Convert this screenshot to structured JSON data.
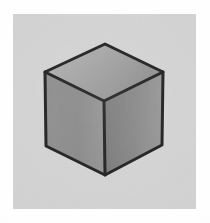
{
  "figure": {
    "title": "Shaded cube line drawing",
    "caption": "",
    "medium": "grayscale scanned illustration",
    "subject_name": "cube",
    "background_color": "#d2d2d2",
    "border_color": "#fefefe",
    "outline_color": "#1c1c1c",
    "panel": {
      "x": 13,
      "y": 14,
      "width": 183,
      "height": 195
    },
    "canvas": {
      "width": 210,
      "height": 223
    }
  },
  "cube": {
    "name": "cube",
    "projection": "isometric",
    "outline_width_px": 3,
    "vertices": {
      "top_apex": [
        105,
        44
      ],
      "upper_left": [
        45,
        72
      ],
      "upper_right": [
        163,
        72
      ],
      "center": [
        104,
        101
      ],
      "lower_left": [
        46,
        146
      ],
      "lower_right": [
        162,
        145
      ],
      "bottom_apex": [
        105,
        175
      ]
    },
    "faces": [
      {
        "name": "top-face",
        "label": "Top face",
        "points": "105,44 45,72 104,101 163,72",
        "gradient": {
          "type": "linear",
          "from": "#b9b9b9",
          "mid": "#9f9f9f",
          "to": "#7e7e7e",
          "angle_deg": 25
        }
      },
      {
        "name": "left-face",
        "label": "Left face",
        "points": "45,72 104,101 105,175 46,146",
        "gradient": {
          "type": "linear",
          "from": "#8b8b8b",
          "mid": "#848484",
          "to": "#939393",
          "angle_deg": 0
        }
      },
      {
        "name": "right-face",
        "label": "Right face",
        "points": "104,101 163,72 162,145 105,175",
        "gradient": {
          "type": "linear",
          "from": "#6f6f6f",
          "mid": "#828282",
          "to": "#9a9a9a",
          "angle_deg": 0
        }
      }
    ],
    "edges": [
      {
        "name": "edge-top-left",
        "from": "top_apex",
        "to": "upper_left"
      },
      {
        "name": "edge-top-right",
        "from": "top_apex",
        "to": "upper_right"
      },
      {
        "name": "edge-top-front-left",
        "from": "upper_left",
        "to": "center"
      },
      {
        "name": "edge-top-front-right",
        "from": "center",
        "to": "upper_right"
      },
      {
        "name": "edge-vertical-left",
        "from": "upper_left",
        "to": "lower_left"
      },
      {
        "name": "edge-vertical-center",
        "from": "center",
        "to": "bottom_apex"
      },
      {
        "name": "edge-vertical-right",
        "from": "upper_right",
        "to": "lower_right"
      },
      {
        "name": "edge-bottom-left",
        "from": "lower_left",
        "to": "bottom_apex"
      },
      {
        "name": "edge-bottom-right",
        "from": "bottom_apex",
        "to": "lower_right"
      }
    ]
  }
}
